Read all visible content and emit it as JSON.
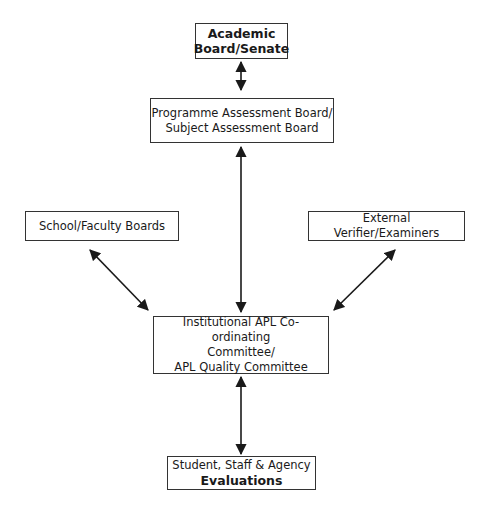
{
  "diagram": {
    "nodes": {
      "academic_board": {
        "line1": "Academic",
        "line2": "Board/Senate"
      },
      "programme_board": {
        "line1": "Programme Assessment Board/",
        "line2": "Subject Assessment Board"
      },
      "school_faculty": {
        "label": "School/Faculty Boards"
      },
      "external_verifier": {
        "label": "External Verifier/Examiners"
      },
      "institutional_apl": {
        "line1": "Institutional APL Co-ordinating",
        "line2": "Committee/",
        "line3": "APL Quality Committee"
      },
      "evaluations": {
        "line1": "Student, Staff & Agency",
        "line2": "Evaluations"
      }
    },
    "edges": [
      {
        "from": "academic_board",
        "to": "programme_board",
        "type": "bidirectional"
      },
      {
        "from": "programme_board",
        "to": "institutional_apl",
        "type": "bidirectional"
      },
      {
        "from": "school_faculty",
        "to": "institutional_apl",
        "type": "bidirectional"
      },
      {
        "from": "external_verifier",
        "to": "institutional_apl",
        "type": "bidirectional"
      },
      {
        "from": "institutional_apl",
        "to": "evaluations",
        "type": "bidirectional"
      }
    ],
    "colors": {
      "line": "#1a1a1a",
      "border": "#333333",
      "background": "#ffffff"
    }
  }
}
